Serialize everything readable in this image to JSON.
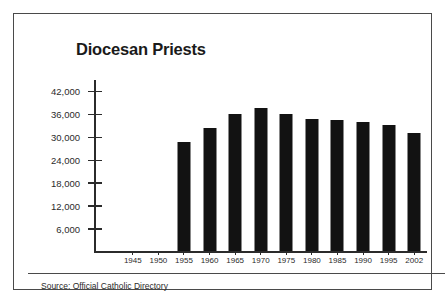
{
  "chart_data": {
    "type": "bar",
    "title": "Diocesan Priests",
    "xlabel": "",
    "ylabel": "",
    "categories": [
      "1945",
      "1950",
      "1955",
      "1960",
      "1965",
      "1970",
      "1975",
      "1980",
      "1985",
      "1990",
      "1995",
      "2002"
    ],
    "values": [
      null,
      null,
      28600,
      32300,
      35900,
      37300,
      35900,
      34600,
      34400,
      33700,
      33000,
      30800
    ],
    "series": [
      {
        "name": "Diocesan Priests",
        "values": [
          null,
          null,
          28600,
          32300,
          35900,
          37300,
          35900,
          34600,
          34400,
          33700,
          33000,
          30800
        ]
      }
    ],
    "ylim": [
      0,
      45000
    ],
    "ytick_values": [
      6000,
      12000,
      18000,
      24000,
      30000,
      36000,
      42000
    ],
    "ytick_labels": [
      "6,000",
      "12,000",
      "18,000",
      "24,000",
      "30,000",
      "36,000",
      "42,000"
    ],
    "grid": false,
    "legend": false,
    "bar_color": "#121212",
    "axis_color": "#2b2b2b"
  },
  "footer": {
    "source": "Source: Official Catholic Directory"
  }
}
